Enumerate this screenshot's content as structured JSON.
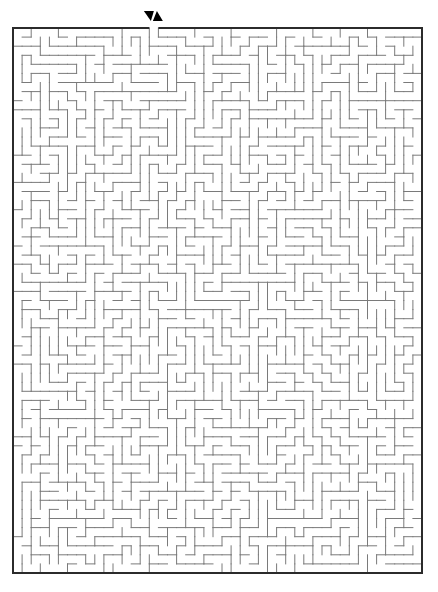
{
  "puzzle": {
    "type": "maze",
    "label": "Rectangular maze puzzle",
    "columns": 45,
    "rows": 60,
    "entrance": {
      "side": "top",
      "column": 15,
      "markers": [
        {
          "name": "down-triangle-icon",
          "direction": "down"
        },
        {
          "name": "up-triangle-icon",
          "direction": "up"
        }
      ]
    }
  },
  "layout": {
    "canvas": {
      "width": 438,
      "height": 592
    },
    "box": {
      "left": 13,
      "top": 28,
      "right": 422,
      "bottom": 573
    },
    "markers_y": [
      11,
      21
    ]
  },
  "colors": {
    "background": "#ffffff",
    "border": "#2b2b2b",
    "wall": "#7a7a7a",
    "marker": "#000000"
  }
}
